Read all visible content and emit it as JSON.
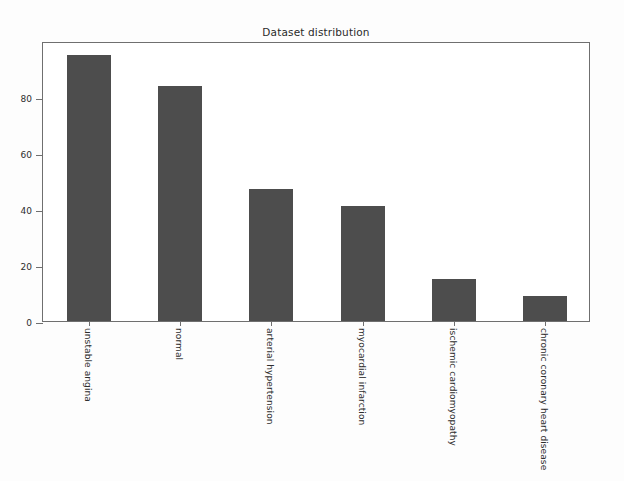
{
  "chart_data": {
    "type": "bar",
    "title": "Dataset distribution",
    "xlabel": "",
    "ylabel": "",
    "grid": false,
    "legend": null,
    "categories": [
      "unstable angina",
      "normal",
      "arterial hypertension",
      "myocardial infarction",
      "ischemic cardiomyopathy",
      "chronic coronary heart disease"
    ],
    "values": [
      95,
      84,
      47,
      41,
      15,
      9
    ],
    "ylim": [
      0,
      100
    ],
    "yticks": [
      0,
      20,
      40,
      60,
      80
    ],
    "ytick_labels": [
      "0",
      "20",
      "40",
      "60",
      "80"
    ],
    "bar_color": "#4d4d4d",
    "axis_color": "#6f6f6f",
    "background_color": "#ffffff"
  }
}
